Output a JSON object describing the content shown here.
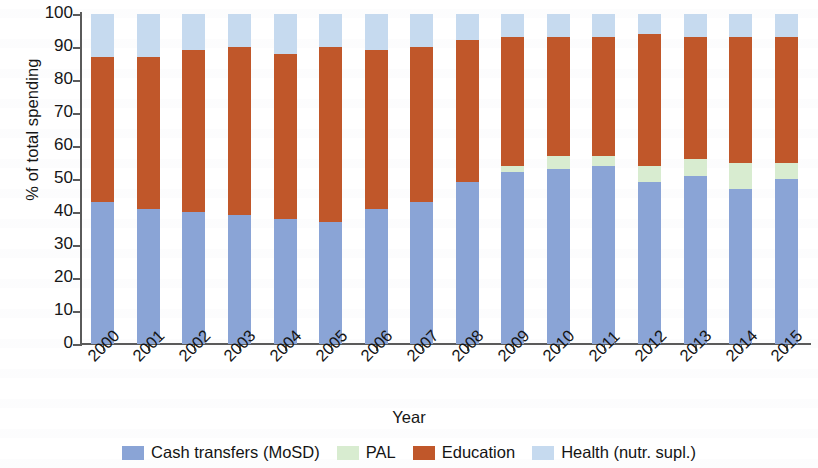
{
  "chart_data": {
    "type": "bar",
    "stacked": true,
    "stack_normalized": true,
    "title": "",
    "xlabel": "Year",
    "ylabel": "% of total spending",
    "ylim": [
      0,
      100
    ],
    "yticks": [
      0,
      10,
      20,
      30,
      40,
      50,
      60,
      70,
      80,
      90,
      100
    ],
    "ytick_labels": [
      "0",
      "10",
      "20",
      "30",
      "40",
      "50",
      "60",
      "70",
      "80",
      "90",
      "100"
    ],
    "grid": false,
    "legend_position": "bottom",
    "categories": [
      "2000",
      "2001",
      "2002",
      "2003",
      "2004",
      "2005",
      "2006",
      "2007",
      "2008",
      "2009",
      "2010",
      "2011",
      "2012",
      "2013",
      "2014",
      "2015"
    ],
    "series": [
      {
        "name": "Cash transfers (MoSD)",
        "color": "#8aa4d6",
        "values": [
          43,
          41,
          40,
          39,
          38,
          37,
          41,
          43,
          49,
          52,
          53,
          54,
          49,
          51,
          47,
          50
        ]
      },
      {
        "name": "PAL",
        "color": "#d8ecd0",
        "values": [
          0,
          0,
          0,
          0,
          0,
          0,
          0,
          0,
          0,
          2,
          4,
          3,
          5,
          5,
          8,
          5
        ]
      },
      {
        "name": "Education",
        "color": "#c0572a",
        "values": [
          44,
          46,
          49,
          51,
          50,
          53,
          48,
          47,
          43,
          39,
          36,
          36,
          40,
          37,
          38,
          38
        ]
      },
      {
        "name": "Health (nutr. supl.)",
        "color": "#c6daef",
        "values": [
          13,
          13,
          11,
          10,
          12,
          10,
          11,
          10,
          8,
          7,
          7,
          7,
          6,
          7,
          7,
          7
        ]
      }
    ]
  },
  "axes": {
    "y_title": "% of total spending",
    "x_title": "Year"
  },
  "legend": {
    "items": [
      {
        "label": "Cash transfers (MoSD)",
        "color": "#8aa4d6",
        "icon": "legend-swatch-cash-transfers"
      },
      {
        "label": "PAL",
        "color": "#d8ecd0",
        "icon": "legend-swatch-pal"
      },
      {
        "label": "Education",
        "color": "#c0572a",
        "icon": "legend-swatch-education"
      },
      {
        "label": "Health (nutr. supl.)",
        "color": "#c6daef",
        "icon": "legend-swatch-health"
      }
    ]
  },
  "colors": {
    "cash_transfers": "#8aa4d6",
    "pal": "#d8ecd0",
    "education": "#c0572a",
    "health": "#c6daef",
    "axis": "#5a5a5a",
    "text": "#141414",
    "background": "#ffffff"
  }
}
